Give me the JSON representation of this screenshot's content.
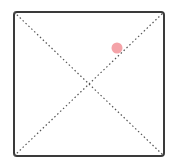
{
  "diagram": {
    "frame": {
      "x": 14,
      "y": 12,
      "width": 150,
      "height": 144,
      "stroke": "#3a3a3a",
      "stroke_width": 2,
      "corner_radius": 3
    },
    "diagonals": {
      "stroke": "#555555",
      "dash": "1.5 2.5",
      "stroke_width": 1.2
    },
    "marker": {
      "cx": 117,
      "cy": 48,
      "r": 5.5,
      "fill": "#f4a3a8"
    }
  }
}
